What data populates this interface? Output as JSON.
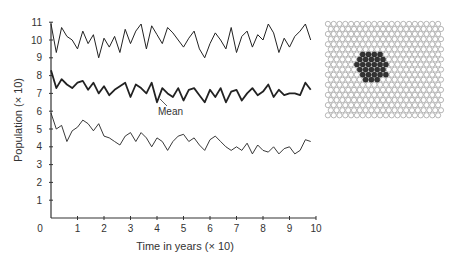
{
  "chart_data": {
    "type": "line",
    "title": "",
    "xlabel": "Time in years (× 10)",
    "ylabel": "Population (× 10)",
    "xlim": [
      0,
      10
    ],
    "ylim": [
      0,
      11
    ],
    "xticks": [
      "0",
      "1",
      "2",
      "3",
      "4",
      "5",
      "6",
      "7",
      "8",
      "9",
      "10"
    ],
    "yticks": [
      "1",
      "2",
      "3",
      "4",
      "5",
      "6",
      "7",
      "8",
      "9",
      "10",
      "11"
    ],
    "grid": false,
    "annotations": [
      {
        "text": "Mean",
        "x": 4.3,
        "y": 5.8
      }
    ],
    "x": [
      0,
      0.2,
      0.4,
      0.6,
      0.8,
      1.0,
      1.2,
      1.4,
      1.6,
      1.8,
      2.0,
      2.2,
      2.4,
      2.6,
      2.8,
      3.0,
      3.2,
      3.4,
      3.6,
      3.8,
      4.0,
      4.2,
      4.4,
      4.6,
      4.8,
      5.0,
      5.2,
      5.4,
      5.6,
      5.8,
      6.0,
      6.2,
      6.4,
      6.6,
      6.8,
      7.0,
      7.2,
      7.4,
      7.6,
      7.8,
      8.0,
      8.2,
      8.4,
      8.6,
      8.8,
      9.0,
      9.2,
      9.4,
      9.6,
      9.8
    ],
    "series": [
      {
        "name": "Upper",
        "values": [
          10.9,
          9.3,
          10.7,
          10.2,
          10.0,
          9.5,
          10.5,
          9.8,
          10.3,
          9.0,
          10.1,
          9.6,
          10.2,
          9.3,
          10.6,
          9.8,
          10.5,
          10.9,
          9.5,
          10.8,
          10.3,
          9.8,
          10.7,
          10.4,
          10.0,
          9.6,
          10.1,
          10.5,
          9.5,
          9.0,
          9.8,
          10.4,
          10.0,
          9.5,
          10.7,
          9.3,
          10.2,
          10.5,
          9.6,
          10.3,
          10.0,
          10.9,
          10.4,
          9.3,
          10.1,
          9.6,
          10.2,
          10.5,
          10.9,
          10.0
        ]
      },
      {
        "name": "Mean",
        "values": [
          8.3,
          7.3,
          7.8,
          7.5,
          7.3,
          7.6,
          7.7,
          7.2,
          7.6,
          7.0,
          7.4,
          6.9,
          7.2,
          7.4,
          7.6,
          6.8,
          7.5,
          7.3,
          7.0,
          7.6,
          6.5,
          7.3,
          7.0,
          6.8,
          7.3,
          6.6,
          7.2,
          7.3,
          6.9,
          6.5,
          7.2,
          6.8,
          7.3,
          6.5,
          7.1,
          7.2,
          6.6,
          7.0,
          7.3,
          6.9,
          7.1,
          7.5,
          6.8,
          7.2,
          6.9,
          7.0,
          7.0,
          6.9,
          7.6,
          7.2
        ]
      },
      {
        "name": "Lower",
        "values": [
          5.9,
          5.0,
          5.2,
          4.3,
          4.9,
          5.1,
          5.5,
          5.3,
          4.9,
          5.3,
          4.6,
          4.5,
          4.3,
          4.1,
          4.6,
          4.8,
          4.3,
          4.8,
          4.5,
          4.0,
          4.5,
          4.3,
          3.8,
          4.3,
          4.6,
          4.7,
          4.3,
          4.5,
          4.1,
          3.8,
          4.4,
          4.6,
          4.3,
          4.0,
          3.8,
          4.0,
          3.8,
          4.2,
          3.6,
          4.1,
          3.8,
          3.7,
          4.0,
          3.6,
          3.9,
          4.0,
          3.6,
          3.8,
          4.4,
          4.3
        ]
      }
    ]
  },
  "inset": {
    "description": "hexagonal lattice with dark central cluster",
    "cell_color": "#ffffff",
    "cell_stroke": "#888888",
    "cluster_color": "#333333"
  }
}
